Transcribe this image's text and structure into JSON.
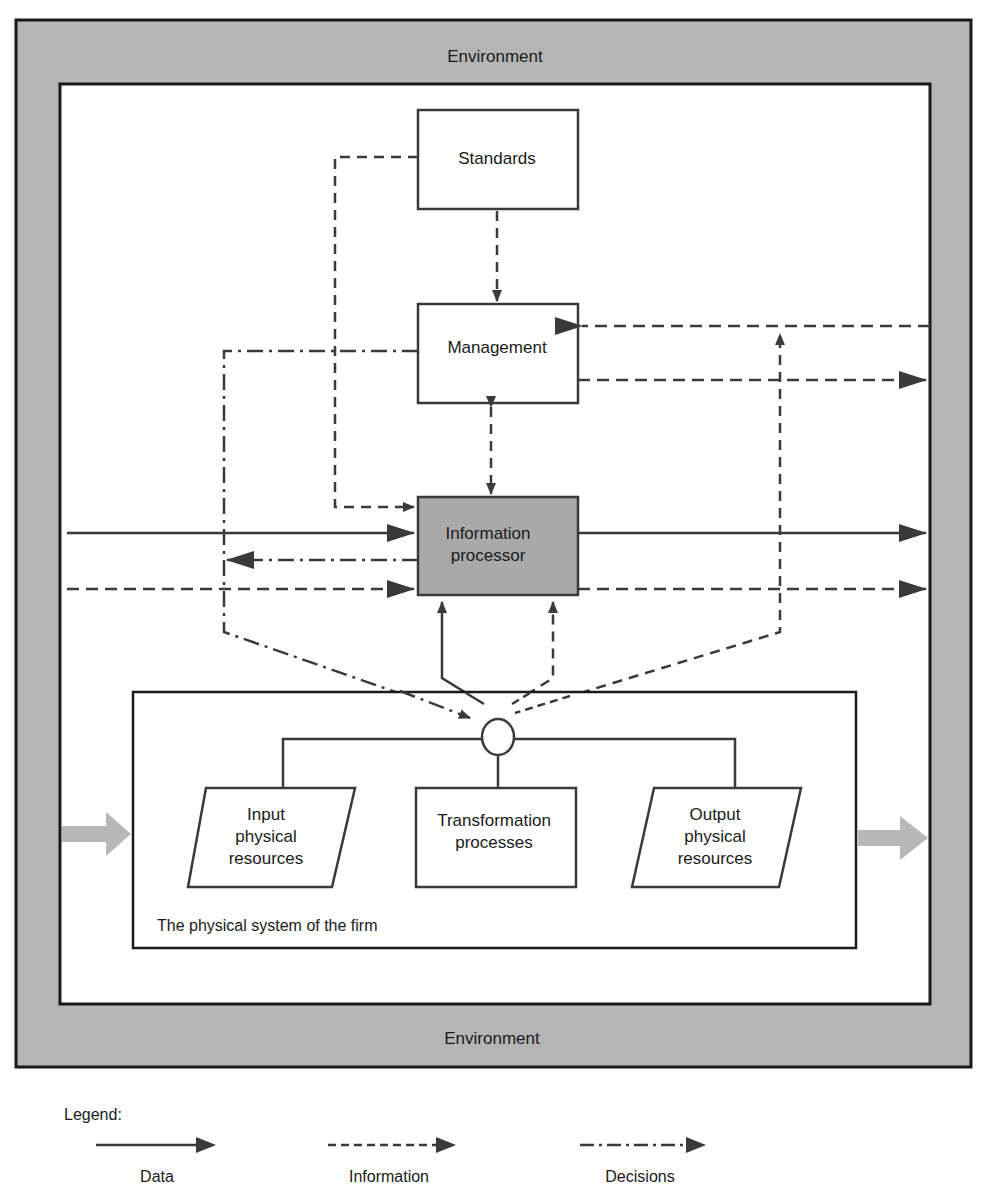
{
  "environment": {
    "top_label": "Environment",
    "bottom_label": "Environment",
    "fill_color": "#b5b5b5"
  },
  "nodes": {
    "standards": "Standards",
    "management": "Management",
    "info_processor": {
      "line1": "Information",
      "line2": "processor",
      "fill_color": "#a9a9a9"
    },
    "input_resources": {
      "line1": "Input",
      "line2": "physical",
      "line3": "resources"
    },
    "transformation": {
      "line1": "Transformation",
      "line2": "processes"
    },
    "output_resources": {
      "line1": "Output",
      "line2": "physical",
      "line3": "resources"
    },
    "physical_system_label": "The physical system of the firm"
  },
  "legend": {
    "title": "Legend:",
    "items": [
      {
        "label": "Data",
        "style": "solid"
      },
      {
        "label": "Information",
        "style": "dashed"
      },
      {
        "label": "Decisions",
        "style": "dash-dot"
      }
    ]
  },
  "colors": {
    "line": "#3a3a3a",
    "border": "#1a1a1a",
    "flow_arrow": "#b8b8b8"
  }
}
